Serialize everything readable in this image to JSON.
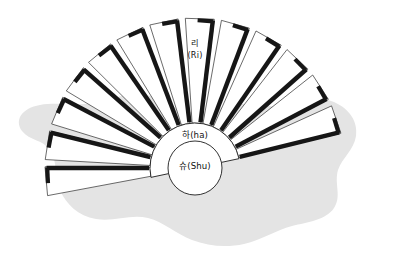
{
  "canvas": {
    "width": 393,
    "height": 276,
    "background_color": "#ffffff"
  },
  "backdrop": {
    "name": "amoeba-blob",
    "fill_color": "#e4e4e4"
  },
  "diagram": {
    "type": "folding-fan",
    "blade_count": 13,
    "paper_fill": "#ffffff",
    "paper_stroke": "#2b2b2b",
    "rib_color": "#161616",
    "hub": {
      "arc_fill": "#ffffff",
      "arc_stroke": "#1b1b1b",
      "core_fill": "#ffffff",
      "core_stroke": "#1b1b1b"
    },
    "geometry": {
      "pivot_x": 195,
      "pivot_y": 168,
      "inner_radius": 45,
      "outer_radius": 150,
      "core_radius": 27,
      "start_angle_deg": -192,
      "end_angle_deg": -12
    }
  },
  "labels": {
    "blade_top": "리\n(Ri)",
    "blade_top_line1": "리",
    "blade_top_line2": "(Ri)",
    "hub_arc": "하(ha)",
    "hub_core": "슈(Shu)"
  }
}
